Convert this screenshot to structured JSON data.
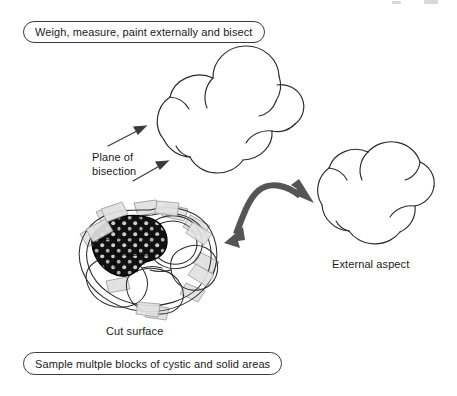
{
  "diagram": {
    "title_top": "Weigh, measure, paint externally and bisect",
    "title_bottom": "Sample multple blocks of cystic and solid areas",
    "captions": {
      "plane_line1": "Plane of",
      "plane_line2": "bisection",
      "cut_surface": "Cut surface",
      "external_aspect": "External aspect"
    },
    "colors": {
      "outline": "#2b2b2b",
      "box_border": "#3a3a3a",
      "background": "#ffffff",
      "arrow_gray": "#555555",
      "thin_arrow": "#3a3a3a",
      "solid_nodule": "#111111",
      "nodule_dot": "#e8e8e8",
      "sample_block_fill": "#e2e2e2",
      "sample_block_stroke": "#9a9a9a",
      "text": "#1a1a1a"
    },
    "elements": {
      "specimen_whole": "lobulated ovarian mass outline, whole specimen before bisection",
      "specimen_external": "lobulated ovarian mass outline, external aspect after bisection",
      "specimen_cut": "multiloculated cystic mass, cut surface with solid nodule and sampling blocks",
      "bisection_arrows": "two thin arrows indicating the plane of bisection",
      "transfer_arrow": "curved double-headed gray arrow linking cut surface and external aspect",
      "sampling_blocks_count": 10
    }
  }
}
